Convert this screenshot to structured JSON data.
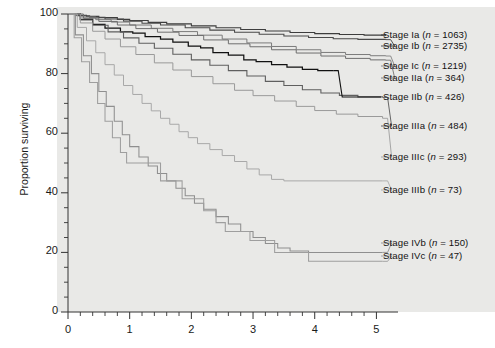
{
  "figure": {
    "background": "#ffffff",
    "panel_color": "#e9e9e7"
  },
  "chart_data": {
    "type": "line",
    "subtype": "kaplan-meier-survival",
    "title": "",
    "xlabel": "",
    "ylabel": "Proportion surviving",
    "xlim": [
      0,
      5.35
    ],
    "ylim": [
      0,
      100
    ],
    "xticks": [
      0,
      1,
      2,
      3,
      4,
      5
    ],
    "xtick_labels": [
      "0",
      "1",
      "2",
      "3",
      "4",
      "5"
    ],
    "xminor_step": 0.2,
    "yticks": [
      0,
      20,
      40,
      60,
      80,
      100
    ],
    "ytick_labels": [
      "0",
      "20",
      "40",
      "60",
      "80",
      "100"
    ],
    "yminor_step": 5,
    "grid": false,
    "legend_position": "right-inline-labels",
    "series": [
      {
        "name": "Stage Ia",
        "label": "Stage Ia (n = 1063)",
        "n": 1063,
        "color": "#3d3d3d",
        "width": 1.1,
        "label_y": 35,
        "end_value": 93.0,
        "points": [
          [
            0,
            100
          ],
          [
            0.12,
            99.6
          ],
          [
            0.3,
            99.2
          ],
          [
            0.5,
            98.8
          ],
          [
            0.8,
            98.2
          ],
          [
            1.0,
            97.8
          ],
          [
            1.3,
            97.2
          ],
          [
            1.6,
            96.7
          ],
          [
            2.0,
            96.0
          ],
          [
            2.4,
            95.4
          ],
          [
            2.8,
            94.8
          ],
          [
            3.2,
            94.3
          ],
          [
            3.6,
            93.8
          ],
          [
            4.0,
            93.4
          ],
          [
            4.4,
            93.1
          ],
          [
            4.8,
            92.9
          ],
          [
            5.15,
            93.0
          ]
        ]
      },
      {
        "name": "Stage Ib",
        "label": "Stage Ib (n = 2735)",
        "n": 2735,
        "color": "#4a4a4a",
        "width": 1.1,
        "label_y": 46,
        "end_value": 91.5,
        "points": [
          [
            0,
            100
          ],
          [
            0.15,
            99.4
          ],
          [
            0.35,
            98.9
          ],
          [
            0.6,
            98.3
          ],
          [
            0.9,
            97.6
          ],
          [
            1.2,
            96.9
          ],
          [
            1.5,
            96.3
          ],
          [
            1.9,
            95.4
          ],
          [
            2.3,
            94.6
          ],
          [
            2.7,
            93.9
          ],
          [
            3.1,
            93.2
          ],
          [
            3.5,
            92.6
          ],
          [
            3.9,
            92.1
          ],
          [
            4.3,
            91.7
          ],
          [
            4.7,
            91.5
          ],
          [
            5.15,
            91.4
          ]
        ]
      },
      {
        "name": "Stage Ic",
        "label": "Stage Ic (n = 1219)",
        "n": 1219,
        "color": "#7b7b7b",
        "width": 1.0,
        "label_y": 66,
        "end_value": 86.0,
        "points": [
          [
            0,
            100
          ],
          [
            0.2,
            99.0
          ],
          [
            0.45,
            98.1
          ],
          [
            0.7,
            97.3
          ],
          [
            1.0,
            96.3
          ],
          [
            1.35,
            95.2
          ],
          [
            1.7,
            94.1
          ],
          [
            2.1,
            92.9
          ],
          [
            2.5,
            91.6
          ],
          [
            2.9,
            90.3
          ],
          [
            3.3,
            89.1
          ],
          [
            3.7,
            88.0
          ],
          [
            4.1,
            87.1
          ],
          [
            4.5,
            86.4
          ],
          [
            4.9,
            86.0
          ],
          [
            5.15,
            85.9
          ]
        ]
      },
      {
        "name": "Stage IIa",
        "label": "Stage IIa (n = 364)",
        "n": 364,
        "color": "#6e6e6e",
        "width": 1.0,
        "label_y": 78,
        "end_value": 84.5,
        "points": [
          [
            0,
            100
          ],
          [
            0.25,
            98.6
          ],
          [
            0.5,
            97.5
          ],
          [
            0.8,
            96.3
          ],
          [
            1.1,
            95.1
          ],
          [
            1.45,
            93.9
          ],
          [
            1.8,
            92.8
          ],
          [
            2.2,
            91.3
          ],
          [
            2.6,
            90.0
          ],
          [
            2.95,
            89.0
          ],
          [
            3.3,
            88.0
          ],
          [
            3.7,
            86.9
          ],
          [
            4.1,
            85.9
          ],
          [
            4.5,
            85.1
          ],
          [
            4.9,
            84.6
          ],
          [
            5.15,
            84.5
          ]
        ]
      },
      {
        "name": "Stage IIb",
        "label": "Stage IIb (n = 426)",
        "n": 426,
        "color": "#111111",
        "width": 1.25,
        "label_y": 97,
        "end_value": 81.0,
        "points": [
          [
            0,
            100
          ],
          [
            0.2,
            98.2
          ],
          [
            0.4,
            96.5
          ],
          [
            0.6,
            95.3
          ],
          [
            0.85,
            94.0
          ],
          [
            1.05,
            93.6
          ],
          [
            1.25,
            92.4
          ],
          [
            1.5,
            91.6
          ],
          [
            1.7,
            90.6
          ],
          [
            1.95,
            89.2
          ],
          [
            2.15,
            88.6
          ],
          [
            2.35,
            87.0
          ],
          [
            2.6,
            86.2
          ],
          [
            2.85,
            84.6
          ],
          [
            3.05,
            84.0
          ],
          [
            3.3,
            83.0
          ],
          [
            3.55,
            82.2
          ],
          [
            3.8,
            81.4
          ],
          [
            4.05,
            81.0
          ],
          [
            4.3,
            81.0
          ]
        ]
      },
      {
        "name": "Stage IIIa",
        "label": "Stage IIIa (n = 484)",
        "n": 484,
        "color": "#5f5f5f",
        "width": 1.1,
        "label_y": 126,
        "end_value": 72.0,
        "points": [
          [
            0,
            100
          ],
          [
            0.2,
            98.0
          ],
          [
            0.4,
            96.2
          ],
          [
            0.65,
            94.0
          ],
          [
            0.9,
            92.0
          ],
          [
            1.15,
            90.2
          ],
          [
            1.4,
            88.5
          ],
          [
            1.7,
            86.5
          ],
          [
            2.0,
            84.6
          ],
          [
            2.3,
            82.8
          ],
          [
            2.6,
            81.0
          ],
          [
            2.9,
            79.2
          ],
          [
            3.2,
            77.4
          ],
          [
            3.5,
            76.0
          ],
          [
            3.8,
            74.6
          ],
          [
            4.1,
            73.5
          ],
          [
            4.4,
            72.7
          ],
          [
            4.7,
            72.2
          ],
          [
            5.1,
            72.0
          ]
        ]
      },
      {
        "name": "Stage IIIc",
        "label": "Stage IIIc (n = 293)",
        "n": 293,
        "color": "#9a9a9a",
        "width": 1.0,
        "label_y": 157,
        "end_value": 65.0,
        "points": [
          [
            0,
            100
          ],
          [
            0.2,
            97.0
          ],
          [
            0.4,
            94.2
          ],
          [
            0.6,
            91.6
          ],
          [
            0.85,
            89.0
          ],
          [
            1.1,
            86.4
          ],
          [
            1.4,
            83.6
          ],
          [
            1.7,
            81.2
          ],
          [
            2.0,
            79.0
          ],
          [
            2.35,
            76.6
          ],
          [
            2.7,
            74.4
          ],
          [
            3.0,
            72.6
          ],
          [
            3.35,
            70.8
          ],
          [
            3.7,
            69.0
          ],
          [
            4.0,
            67.6
          ],
          [
            4.35,
            66.4
          ],
          [
            4.7,
            65.6
          ],
          [
            5.1,
            65.0
          ]
        ]
      },
      {
        "name": "Stage IIIb",
        "label": "Stage IIIb (n = 73)",
        "n": 73,
        "color": "#a8a8a8",
        "width": 1.0,
        "label_y": 190,
        "end_value": 44.0,
        "points": [
          [
            0,
            100
          ],
          [
            0.15,
            95.5
          ],
          [
            0.3,
            91.0
          ],
          [
            0.45,
            87.0
          ],
          [
            0.6,
            83.0
          ],
          [
            0.75,
            79.5
          ],
          [
            0.9,
            76.0
          ],
          [
            1.05,
            73.0
          ],
          [
            1.2,
            70.0
          ],
          [
            1.35,
            67.5
          ],
          [
            1.5,
            65.0
          ],
          [
            1.65,
            63.0
          ],
          [
            1.8,
            60.5
          ],
          [
            1.95,
            58.5
          ],
          [
            2.1,
            56.5
          ],
          [
            2.3,
            54.5
          ],
          [
            2.5,
            52.5
          ],
          [
            2.7,
            50.5
          ],
          [
            2.9,
            48.0
          ],
          [
            3.1,
            46.0
          ],
          [
            3.3,
            44.5
          ],
          [
            3.5,
            44.0
          ],
          [
            5.1,
            44.0
          ]
        ]
      },
      {
        "name": "Stage IVb",
        "label": "Stage IVb (n = 150)",
        "n": 150,
        "color": "#8f8f8f",
        "width": 1.05,
        "label_y": 243,
        "end_value": 20.0,
        "points": [
          [
            0,
            100
          ],
          [
            0.12,
            93.0
          ],
          [
            0.25,
            86.0
          ],
          [
            0.38,
            80.0
          ],
          [
            0.5,
            74.0
          ],
          [
            0.62,
            69.0
          ],
          [
            0.75,
            64.0
          ],
          [
            0.88,
            59.5
          ],
          [
            1.0,
            55.5
          ],
          [
            1.15,
            52.0
          ],
          [
            1.3,
            49.0
          ],
          [
            1.45,
            46.5
          ],
          [
            1.6,
            44.0
          ],
          [
            1.75,
            41.5
          ],
          [
            1.9,
            39.0
          ],
          [
            2.05,
            36.5
          ],
          [
            2.2,
            34.5
          ],
          [
            2.4,
            32.0
          ],
          [
            2.6,
            29.5
          ],
          [
            2.8,
            27.0
          ],
          [
            3.0,
            25.0
          ],
          [
            3.2,
            23.0
          ],
          [
            3.4,
            21.5
          ],
          [
            3.6,
            20.5
          ],
          [
            3.9,
            20.0
          ],
          [
            5.1,
            20.0
          ]
        ]
      },
      {
        "name": "Stage IVc",
        "label": "Stage IVc (n = 47)",
        "n": 47,
        "color": "#9e9e9e",
        "width": 1.05,
        "label_y": 256,
        "end_value": 17.0,
        "points": [
          [
            0,
            100
          ],
          [
            0.1,
            92.0
          ],
          [
            0.22,
            84.0
          ],
          [
            0.35,
            77.0
          ],
          [
            0.48,
            70.0
          ],
          [
            0.6,
            64.0
          ],
          [
            0.72,
            58.5
          ],
          [
            0.85,
            53.5
          ],
          [
            0.95,
            50.0
          ],
          [
            1.1,
            50.0
          ],
          [
            1.3,
            50.0
          ],
          [
            1.5,
            44.0
          ],
          [
            1.7,
            44.0
          ],
          [
            1.85,
            38.0
          ],
          [
            2.0,
            38.0
          ],
          [
            2.2,
            34.0
          ],
          [
            2.4,
            30.0
          ],
          [
            2.55,
            27.0
          ],
          [
            2.75,
            27.0
          ],
          [
            2.95,
            24.0
          ],
          [
            3.15,
            24.0
          ],
          [
            3.35,
            20.0
          ],
          [
            3.6,
            20.0
          ],
          [
            3.9,
            17.0
          ],
          [
            5.1,
            17.0
          ]
        ]
      }
    ]
  }
}
